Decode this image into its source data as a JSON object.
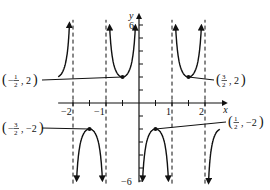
{
  "chart_data": {
    "type": "line",
    "title": "",
    "xlabel": "x",
    "ylabel": "y",
    "xlim": [
      -2.45,
      2.45
    ],
    "ylim": [
      -6,
      6
    ],
    "x_ticks": [
      -2,
      -1.5,
      -1,
      -0.5,
      0.5,
      1,
      1.5,
      2
    ],
    "x_tick_labels": [
      {
        "value": -2,
        "label": "−2"
      },
      {
        "value": -1,
        "label": "−1"
      },
      {
        "value": 1,
        "label": "1"
      },
      {
        "value": 2,
        "label": "2"
      }
    ],
    "y_ticks": [
      -6,
      -5,
      -4,
      -3,
      -2,
      -1,
      1,
      2,
      3,
      4,
      5,
      6
    ],
    "y_tick_labels": [
      {
        "value": 6,
        "label": "6"
      },
      {
        "value": -6,
        "label": "−6"
      }
    ],
    "asymptotes_x": [
      -2,
      -1,
      1,
      2
    ],
    "function": "y = -2 csc(πx)",
    "grid": false,
    "series": [
      {
        "name": "branch-left-partial",
        "domain": [
          -2.45,
          -2.08
        ]
      },
      {
        "name": "branch-(-2,-1)",
        "domain": [
          -1.92,
          -1.08
        ],
        "vertex": [
          -1.5,
          -2
        ]
      },
      {
        "name": "branch-(-1,0)",
        "domain": [
          -0.92,
          -0.08
        ],
        "vertex": [
          -0.5,
          2
        ]
      },
      {
        "name": "branch-(0,1)",
        "domain": [
          0.08,
          0.92
        ],
        "vertex": [
          0.5,
          -2
        ]
      },
      {
        "name": "branch-(1,2)",
        "domain": [
          1.08,
          1.92
        ],
        "vertex": [
          1.5,
          2
        ]
      },
      {
        "name": "branch-right-partial",
        "domain": [
          2.08,
          2.45
        ]
      }
    ],
    "annotations": [
      {
        "point": [
          -0.5,
          2
        ],
        "label_num": "1",
        "label_den": "2",
        "neg": true,
        "y": "2",
        "label_pos": [
          2,
          80
        ]
      },
      {
        "point": [
          1.5,
          2
        ],
        "label_num": "3",
        "label_den": "2",
        "neg": false,
        "y": "2",
        "label_pos": [
          216,
          80
        ]
      },
      {
        "point": [
          -1.5,
          -2
        ],
        "label_num": "3",
        "label_den": "2",
        "neg": true,
        "y": "−2",
        "label_pos": [
          2,
          128
        ]
      },
      {
        "point": [
          0.5,
          -2
        ],
        "label_num": "1",
        "label_den": "2",
        "neg": false,
        "y": "−2",
        "label_pos": [
          228,
          122
        ]
      }
    ]
  }
}
